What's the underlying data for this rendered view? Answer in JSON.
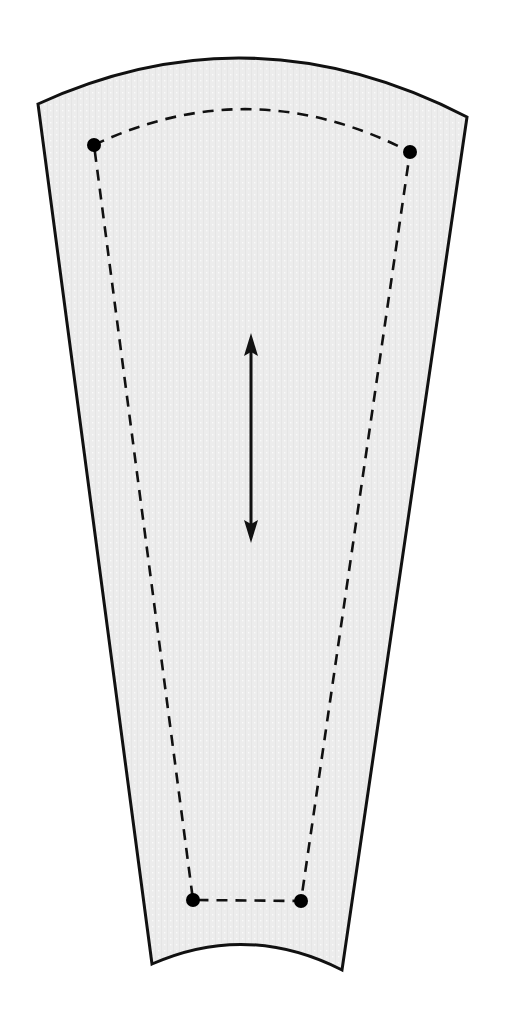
{
  "diagram": {
    "type": "sewing-pattern-piece",
    "colors": {
      "fabric_fill": "#ececec",
      "fabric_dot": "#fafafa",
      "outline": "#111111",
      "seam": "#111111",
      "marker": "#000000",
      "background": "#ffffff"
    },
    "outline": {
      "top_left": [
        38,
        104
      ],
      "top_right": [
        467,
        117
      ],
      "top_arc_peak_y": 55,
      "bottom_left": [
        152,
        964
      ],
      "bottom_right": [
        342,
        970
      ],
      "bottom_arc_peak_y": 946
    },
    "seam_line": {
      "style": "dashed",
      "points": [
        [
          94,
          145
        ],
        [
          410,
          152
        ],
        [
          301,
          901
        ],
        [
          193,
          900
        ]
      ],
      "top_arc_peak_y": 107
    },
    "markers": [
      {
        "name": "top-left-dot",
        "x": 94,
        "y": 145
      },
      {
        "name": "top-right-dot",
        "x": 410,
        "y": 152
      },
      {
        "name": "bottom-right-dot",
        "x": 301,
        "y": 901
      },
      {
        "name": "bottom-left-dot",
        "x": 193,
        "y": 900
      }
    ],
    "grainline": {
      "x": 251,
      "y_top": 333,
      "y_bottom": 543
    }
  }
}
